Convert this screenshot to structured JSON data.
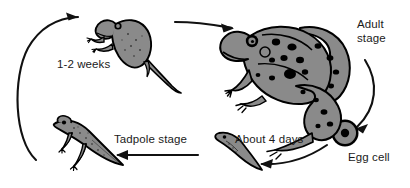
{
  "diagram": {
    "type": "cycle-diagram",
    "direction": "counter-clockwise",
    "background_color": "#ffffff",
    "ink_color": "#000000",
    "fill_color": "#8a8a8a",
    "labels": {
      "weeks": "1-2 weeks",
      "adult": "Adult\nstage",
      "tadpole": "Tadpole stage",
      "days": "About 4 days",
      "egg": "Egg cell"
    },
    "stages": [
      {
        "name": "egg-cell",
        "label": "Egg cell"
      },
      {
        "name": "young-tadpole",
        "label": "About 4 days"
      },
      {
        "name": "tadpole-with-legs",
        "label": "Tadpole stage"
      },
      {
        "name": "young-frog",
        "label": "1-2 weeks"
      },
      {
        "name": "adult-frog",
        "label": "Adult stage"
      }
    ],
    "arrows": [
      {
        "name": "arrow-tadpole-to-young-frog",
        "shape": "curved",
        "points": "left-up-right"
      },
      {
        "name": "arrow-young-frog-to-adult",
        "shape": "slight-curve",
        "points": "right"
      },
      {
        "name": "arrow-adult-to-egg",
        "shape": "curved",
        "points": "down-left"
      },
      {
        "name": "arrow-egg-to-young-tadpole",
        "shape": "curved",
        "points": "left"
      },
      {
        "name": "arrow-young-tadpole-to-tadpole",
        "shape": "straight",
        "points": "left"
      }
    ]
  }
}
